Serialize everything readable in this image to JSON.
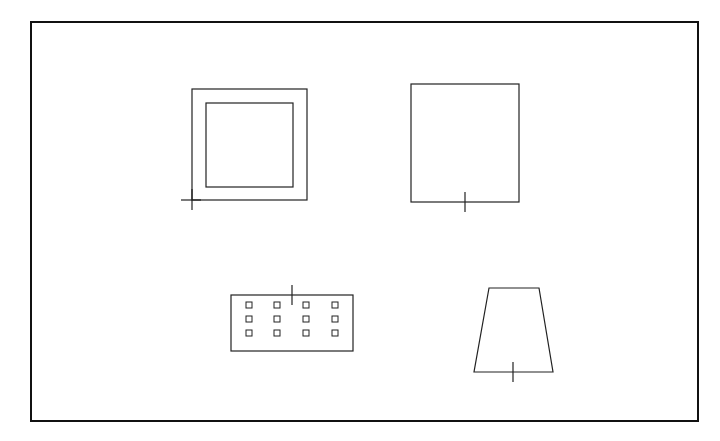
{
  "diagram": {
    "type": "schematic shapes",
    "background": "#ffffff",
    "stroke": "#222222",
    "frame": {
      "x": 31,
      "y": 22,
      "w": 667,
      "h": 399,
      "stroke_width": 2
    },
    "shapes": [
      {
        "name": "square-frame",
        "outer": {
          "x": 192,
          "y": 89,
          "w": 115,
          "h": 111
        },
        "inner": {
          "x": 206,
          "y": 103,
          "w": 87,
          "h": 84
        },
        "crosshair": {
          "x": 192,
          "y": 200,
          "h1": 181,
          "h2": 201,
          "v1": 189,
          "v2": 210
        }
      },
      {
        "name": "rectangle",
        "rect": {
          "x": 411,
          "y": 84,
          "w": 108,
          "h": 118
        },
        "tick": {
          "x": 465,
          "y1": 192,
          "y2": 212
        }
      },
      {
        "name": "grid-block",
        "rect": {
          "x": 231,
          "y": 295,
          "w": 122,
          "h": 56
        },
        "cells": {
          "cols": [
            249,
            277,
            306,
            335
          ],
          "rows": [
            305,
            319,
            333
          ],
          "size": 6
        },
        "tick": {
          "x": 292,
          "y1": 285,
          "y2": 305
        }
      },
      {
        "name": "trapezoid",
        "points": [
          [
            489,
            288
          ],
          [
            539,
            288
          ],
          [
            553,
            372
          ],
          [
            474,
            372
          ]
        ],
        "tick": {
          "x": 513,
          "y1": 362,
          "y2": 382
        }
      }
    ]
  }
}
